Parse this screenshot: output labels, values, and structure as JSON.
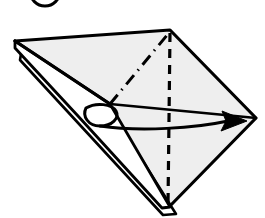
{
  "diagram": {
    "kind": "origami-fold-instruction",
    "canvas": {
      "width": 265,
      "height": 218
    },
    "background_color": "#ffffff",
    "paper": {
      "fill_color": "#eeeeee",
      "back_fill_color": "#ffffff",
      "outline_color": "#000000",
      "outline_width": 3.2
    },
    "step_marker": {
      "label": "",
      "shape": "circle-outline",
      "note": "step number circle, cropped off the top edge of the image",
      "center_x": 45,
      "center_y": -9,
      "radius": 15,
      "stroke_color": "#000000",
      "stroke_width": 3
    },
    "shape": {
      "name": "kite-square-base",
      "vertices": {
        "left": {
          "x": 15,
          "y": 41
        },
        "top": {
          "x": 170,
          "y": 30
        },
        "right": {
          "x": 256,
          "y": 118
        },
        "bottom": {
          "x": 168,
          "y": 208
        }
      }
    },
    "creases": [
      {
        "name": "valley-fold-vertical",
        "style": "dashed",
        "color": "#000000",
        "width": 3.2,
        "from": {
          "x": 170,
          "y": 33
        },
        "to": {
          "x": 168,
          "y": 205
        },
        "dash_pattern": "9 7"
      },
      {
        "name": "mountain-fold-diagonal",
        "style": "dash-dot",
        "color": "#000000",
        "width": 3.0,
        "from": {
          "x": 110,
          "y": 104
        },
        "to": {
          "x": 168,
          "y": 34
        },
        "dash_pattern": "12 6 1.5 6"
      }
    ],
    "fold_lines": [
      {
        "name": "upper-left-flap-edge",
        "from": {
          "x": 15,
          "y": 41
        },
        "to": {
          "x": 110,
          "y": 104
        },
        "color": "#000000",
        "width": 3.2
      },
      {
        "name": "horizontal-center-edge",
        "from": {
          "x": 110,
          "y": 104
        },
        "to": {
          "x": 256,
          "y": 118
        },
        "color": "#000000",
        "width": 2.6
      }
    ],
    "layers": [
      {
        "name": "lower-left-layer-sliver",
        "description": "narrow doubled paper layer along lower-left edge",
        "fill": "#ffffff",
        "outline": "#000000"
      },
      {
        "name": "bottom-second-layer",
        "description": "second sheet layer visible at the bottom point",
        "fill": "#ffffff",
        "outline": "#000000"
      }
    ],
    "action_arrow": {
      "name": "fold-over-arrow",
      "type": "curved-arrow-with-loop",
      "direction": "left-to-right",
      "color": "#000000",
      "stroke_width": 3.0,
      "start": {
        "x": 86,
        "y": 110
      },
      "end": {
        "x": 247,
        "y": 122
      },
      "head_length": 26,
      "head_width": 20,
      "has_wrap_loop": true,
      "loop_note": "small hook loop at the tail wrapping around the left flap edge"
    }
  }
}
